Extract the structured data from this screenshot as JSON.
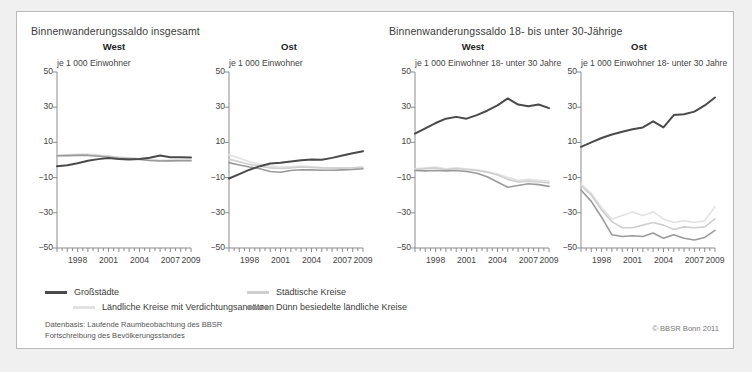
{
  "figure": {
    "group_titles": {
      "left": "Binnenwanderungssaldo insgesamt",
      "right": "Binnenwanderungssaldo 18- bis unter 30-Jährige"
    },
    "source_line1": "Datenbasis: Laufende Raumbeobachtung des BBSR",
    "source_line2": "Fortschreibung des Bevölkerungsstandes",
    "copyright": "© BBSR Bonn 2011"
  },
  "legend": {
    "items": [
      {
        "label": "Großstädte",
        "color": "#4a4a4a"
      },
      {
        "label": "Städtische Kreise",
        "color": "#cfcfcf"
      },
      {
        "label": "Ländliche Kreise mit Verdichtungsansätzen",
        "color": "#e2e2e2"
      },
      {
        "label": "Dünn besiedelte ländliche Kreise",
        "color": "#9a9a9a"
      }
    ]
  },
  "colors": {
    "grossstaedte": "#4a4a4a",
    "staedtische": "#cfcfcf",
    "laendliche_verdichtung": "#e2e2e2",
    "duenn_besiedelt": "#9a9a9a",
    "axis": "#8c8c8c",
    "text": "#3c3c3c",
    "frame": "#b9b9b9",
    "page_background": "#f0f0f0",
    "figure_background": "#ffffff"
  },
  "chart_data": [
    {
      "id": "total-west",
      "type": "line",
      "title": "West",
      "group": "Binnenwanderungssaldo insgesamt",
      "ylabel": "je 1 000 Einwohner",
      "xlabel": "",
      "ylim": [
        -50,
        50
      ],
      "yticks": [
        50,
        30,
        10,
        -10,
        -30,
        -50
      ],
      "xlim": [
        1996,
        2009
      ],
      "x": [
        1996,
        1997,
        1998,
        1999,
        2000,
        2001,
        2002,
        2003,
        2004,
        2005,
        2006,
        2007,
        2008,
        2009
      ],
      "xticks": [
        1998,
        2001,
        2004,
        2007,
        2009
      ],
      "grid": false,
      "legend_position": "below-figure",
      "series": [
        {
          "name": "Großstädte",
          "color": "#4a4a4a",
          "values": [
            -3.5,
            -3.0,
            -1.8,
            -0.4,
            0.5,
            1.2,
            0.5,
            0.3,
            0.6,
            1.3,
            2.5,
            1.6,
            1.5,
            1.4
          ]
        },
        {
          "name": "Städtische Kreise",
          "color": "#cfcfcf",
          "values": [
            2.5,
            2.6,
            2.8,
            3.0,
            2.6,
            2.1,
            1.5,
            1.1,
            0.6,
            0.0,
            -0.4,
            -0.3,
            -0.2,
            -0.2
          ]
        },
        {
          "name": "Ländliche Kreise mit Verdichtungsansätzen",
          "color": "#e2e2e2",
          "values": [
            2.6,
            2.9,
            3.2,
            3.4,
            3.0,
            2.3,
            1.6,
            1.2,
            0.8,
            0.2,
            -0.2,
            -0.1,
            0.0,
            0.0
          ]
        },
        {
          "name": "Dünn besiedelte ländliche Kreise",
          "color": "#9a9a9a",
          "values": [
            2.4,
            2.5,
            2.6,
            2.6,
            2.1,
            1.6,
            1.0,
            0.7,
            0.3,
            -0.3,
            -0.6,
            -0.5,
            -0.4,
            -0.4
          ]
        }
      ]
    },
    {
      "id": "total-ost",
      "type": "line",
      "title": "Ost",
      "group": "Binnenwanderungssaldo insgesamt",
      "ylabel": "je 1 000 Einwohner",
      "xlabel": "",
      "ylim": [
        -50,
        50
      ],
      "yticks": [
        50,
        30,
        10,
        -10,
        -30,
        -50
      ],
      "xlim": [
        1996,
        2009
      ],
      "x": [
        1996,
        1997,
        1998,
        1999,
        2000,
        2001,
        2002,
        2003,
        2004,
        2005,
        2006,
        2007,
        2008,
        2009
      ],
      "xticks": [
        1998,
        2001,
        2004,
        2007,
        2009
      ],
      "grid": false,
      "legend_position": "below-figure",
      "series": [
        {
          "name": "Großstädte",
          "color": "#4a4a4a",
          "values": [
            -10.5,
            -8.0,
            -5.5,
            -3.5,
            -2.0,
            -1.5,
            -0.8,
            -0.2,
            0.3,
            0.2,
            1.2,
            2.5,
            3.8,
            5.0
          ]
        },
        {
          "name": "Städtische Kreise",
          "color": "#cfcfcf",
          "values": [
            0.5,
            -1.0,
            -2.5,
            -3.5,
            -4.5,
            -4.8,
            -4.5,
            -4.0,
            -4.2,
            -4.5,
            -4.6,
            -4.6,
            -4.5,
            -4.2
          ]
        },
        {
          "name": "Ländliche Kreise mit Verdichtungsansätzen",
          "color": "#e2e2e2",
          "values": [
            3.0,
            1.0,
            -1.0,
            -2.5,
            -3.5,
            -4.0,
            -3.8,
            -3.5,
            -4.0,
            -4.4,
            -4.5,
            -4.5,
            -4.4,
            -4.0
          ]
        },
        {
          "name": "Dünn besiedelte ländliche Kreise",
          "color": "#9a9a9a",
          "values": [
            -1.5,
            -2.8,
            -4.0,
            -5.0,
            -6.5,
            -7.0,
            -6.0,
            -5.5,
            -5.6,
            -5.8,
            -5.8,
            -5.6,
            -5.4,
            -5.0
          ]
        }
      ]
    },
    {
      "id": "young-west",
      "type": "line",
      "title": "West",
      "group": "Binnenwanderungssaldo 18- bis unter 30-Jährige",
      "ylabel": "je 1 000 Einwohner 18- unter 30 Jahre",
      "xlabel": "",
      "ylim": [
        -50,
        50
      ],
      "yticks": [
        50,
        30,
        10,
        -10,
        -30,
        -50
      ],
      "xlim": [
        1996,
        2009
      ],
      "x": [
        1996,
        1997,
        1998,
        1999,
        2000,
        2001,
        2002,
        2003,
        2004,
        2005,
        2006,
        2007,
        2008,
        2009
      ],
      "xticks": [
        1998,
        2001,
        2004,
        2007,
        2009
      ],
      "grid": false,
      "legend_position": "below-figure",
      "series": [
        {
          "name": "Großstädte",
          "color": "#4a4a4a",
          "values": [
            15.0,
            18.0,
            21.0,
            23.5,
            24.5,
            23.5,
            25.5,
            28.0,
            31.0,
            35.0,
            31.5,
            30.5,
            31.5,
            29.5
          ]
        },
        {
          "name": "Städtische Kreise",
          "color": "#cfcfcf",
          "values": [
            -5.5,
            -5.0,
            -4.5,
            -5.5,
            -4.8,
            -5.5,
            -6.0,
            -7.0,
            -8.5,
            -11.0,
            -12.5,
            -12.0,
            -12.5,
            -13.0
          ]
        },
        {
          "name": "Ländliche Kreise mit Verdichtungsansätzen",
          "color": "#e2e2e2",
          "values": [
            -5.0,
            -4.5,
            -4.0,
            -5.0,
            -4.5,
            -5.0,
            -5.5,
            -6.5,
            -8.0,
            -10.0,
            -11.5,
            -11.0,
            -11.5,
            -12.0
          ]
        },
        {
          "name": "Dünn besiedelte ländliche Kreise",
          "color": "#9a9a9a",
          "values": [
            -6.0,
            -6.2,
            -6.0,
            -6.2,
            -6.0,
            -6.5,
            -7.5,
            -9.5,
            -12.5,
            -15.5,
            -14.5,
            -13.5,
            -14.0,
            -15.0
          ]
        }
      ]
    },
    {
      "id": "young-ost",
      "type": "line",
      "title": "Ost",
      "group": "Binnenwanderungssaldo 18- bis unter 30-Jährige",
      "ylabel": "je 1 000 Einwohner 18- unter 30 Jahre",
      "xlabel": "",
      "ylim": [
        -50,
        50
      ],
      "yticks": [
        50,
        30,
        10,
        -10,
        -30,
        -50
      ],
      "xlim": [
        1996,
        2009
      ],
      "x": [
        1996,
        1997,
        1998,
        1999,
        2000,
        2001,
        2002,
        2003,
        2004,
        2005,
        2006,
        2007,
        2008,
        2009
      ],
      "xticks": [
        1998,
        2001,
        2004,
        2007,
        2009
      ],
      "grid": false,
      "legend_position": "below-figure",
      "series": [
        {
          "name": "Großstädte",
          "color": "#4a4a4a",
          "values": [
            7.5,
            10.0,
            12.5,
            14.5,
            16.0,
            17.5,
            18.5,
            22.0,
            18.5,
            25.5,
            26.0,
            27.5,
            31.0,
            35.5
          ]
        },
        {
          "name": "Städtische Kreise",
          "color": "#cfcfcf",
          "values": [
            -14.5,
            -20.0,
            -28.5,
            -35.0,
            -38.5,
            -38.5,
            -37.0,
            -35.5,
            -37.0,
            -39.5,
            -38.0,
            -38.5,
            -38.0,
            -33.5
          ]
        },
        {
          "name": "Ländliche Kreise mit Verdichtungsansätzen",
          "color": "#e2e2e2",
          "values": [
            -13.5,
            -19.0,
            -27.0,
            -33.5,
            -31.5,
            -29.5,
            -31.5,
            -29.5,
            -33.5,
            -35.5,
            -34.5,
            -35.5,
            -34.5,
            -26.5
          ]
        },
        {
          "name": "Dünn besiedelte ländliche Kreise",
          "color": "#9a9a9a",
          "values": [
            -17.0,
            -23.5,
            -32.5,
            -42.5,
            -43.5,
            -43.0,
            -43.5,
            -41.5,
            -44.5,
            -42.5,
            -44.5,
            -45.5,
            -44.0,
            -40.0
          ]
        }
      ]
    }
  ]
}
